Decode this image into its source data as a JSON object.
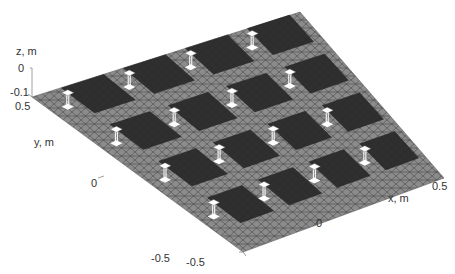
{
  "chart_data": {
    "type": "surface-3d",
    "title": "",
    "xlabel": "x, m",
    "ylabel": "y, m",
    "zlabel": "z, m",
    "x_ticks": [
      "0",
      "0.5"
    ],
    "x_ticks_all": [
      "-0.5",
      "0",
      "0.5"
    ],
    "y_ticks": [
      "-0.5",
      "0",
      "0.5"
    ],
    "z_ticks": [
      "0",
      "-0.1"
    ],
    "xlim": [
      -0.5,
      0.5
    ],
    "ylim": [
      -0.5,
      0.5
    ],
    "zlim": [
      -0.1,
      0
    ],
    "ground_plane_color": "#8a8a8a",
    "patch_color": "#2e2e2e",
    "mesh_line_color": "#3a3a3a",
    "array_rows": 4,
    "array_cols": 4
  },
  "labels": {
    "z_axis": "z, m",
    "z_tick_0": "0",
    "z_tick_neg": "-0.1",
    "y_tick_top": "0.5",
    "y_axis": "y, m",
    "y_tick_mid": "0",
    "y_tick_bottom": "-0.5",
    "x_tick_left": "-0.5",
    "x_tick_mid": "0",
    "x_tick_right": "0.5",
    "x_axis": "x, m"
  }
}
